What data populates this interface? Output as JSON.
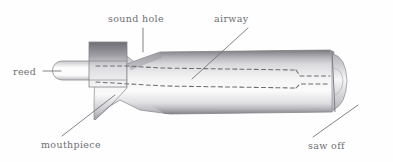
{
  "figure": {
    "background_color": "#fefefe",
    "ink_color": "#6e6e72",
    "medium": "pencil drawing"
  },
  "labels": {
    "sound_hole": "sound hole",
    "airway": "airway",
    "reed": "reed",
    "mouthpiece": "mouthpiece",
    "saw_off": "saw off"
  },
  "parts": [
    {
      "id": "reed",
      "label": "reed",
      "position": "left",
      "leader": "horizontal"
    },
    {
      "id": "mouthpiece",
      "label": "mouthpiece",
      "position": "bottom-left",
      "leader": "diagonal-up-right"
    },
    {
      "id": "sound-hole",
      "label": "sound hole",
      "position": "top-left",
      "leader": "vertical-down"
    },
    {
      "id": "airway",
      "label": "airway",
      "position": "top-right",
      "leader": "diagonal-down-left"
    },
    {
      "id": "saw-off",
      "label": "saw off",
      "position": "bottom-right",
      "leader": "diagonal-up-right"
    }
  ]
}
